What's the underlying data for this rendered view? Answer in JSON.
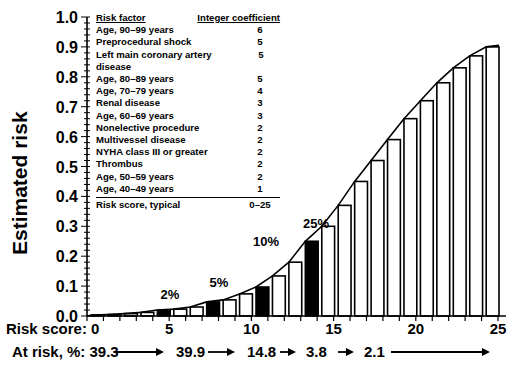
{
  "chart_data": {
    "type": "bar",
    "title": "",
    "xlabel": "Risk score",
    "ylabel": "Estimated risk",
    "ylim": [
      0,
      1.0
    ],
    "xlim": [
      0,
      25
    ],
    "yticks": [
      "0.0",
      "0.1",
      "0.2",
      "0.3",
      "0.4",
      "0.5",
      "0.6",
      "0.7",
      "0.8",
      "0.9",
      "1.0"
    ],
    "xticks": [
      "0",
      "5",
      "10",
      "15",
      "20",
      "25"
    ],
    "grid": false,
    "categories": [
      1,
      2,
      3,
      4,
      5,
      6,
      7,
      8,
      9,
      10,
      11,
      12,
      13,
      14,
      15,
      16,
      17,
      18,
      19,
      20,
      21,
      22,
      23,
      24,
      25
    ],
    "values": [
      0.003,
      0.005,
      0.008,
      0.012,
      0.02,
      0.023,
      0.03,
      0.047,
      0.054,
      0.074,
      0.097,
      0.134,
      0.18,
      0.25,
      0.3,
      0.37,
      0.45,
      0.52,
      0.59,
      0.66,
      0.72,
      0.78,
      0.83,
      0.87,
      0.9
    ],
    "highlighted": [
      5,
      8,
      11,
      14
    ],
    "annotations": [
      {
        "score": 5,
        "label": "2%"
      },
      {
        "score": 8,
        "label": "5%"
      },
      {
        "score": 11,
        "label": "10%"
      },
      {
        "score": 14,
        "label": "25%"
      }
    ],
    "fitted_curve": true,
    "legend_table": {
      "headers": [
        "Risk factor",
        "Integer coefficient"
      ],
      "rows": [
        [
          "Age, 90–99 years",
          "6"
        ],
        [
          "Preprocedural shock",
          "5"
        ],
        [
          "Left main coronary artery disease",
          "5"
        ],
        [
          "Age, 80–89 years",
          "5"
        ],
        [
          "Age, 70–79 years",
          "4"
        ],
        [
          "Renal disease",
          "3"
        ],
        [
          "Age, 60–69 years",
          "3"
        ],
        [
          "Nonelective procedure",
          "2"
        ],
        [
          "Multivessel disease",
          "2"
        ],
        [
          "NYHA class III or greater",
          "2"
        ],
        [
          "Thrombus",
          "2"
        ],
        [
          "Age, 50–59 years",
          "2"
        ],
        [
          "Age, 40–49 years",
          "1"
        ]
      ],
      "total": [
        "Risk score, typical",
        "0–25"
      ]
    },
    "at_risk": {
      "label": "At risk, %:",
      "values": [
        "39.3",
        "39.9",
        "14.8",
        "3.8",
        "2.1"
      ]
    }
  },
  "labels": {
    "ylabel": "Estimated risk",
    "risk_score_label": "Risk score: 0",
    "at_risk_label": "At risk, %: 39.3"
  }
}
